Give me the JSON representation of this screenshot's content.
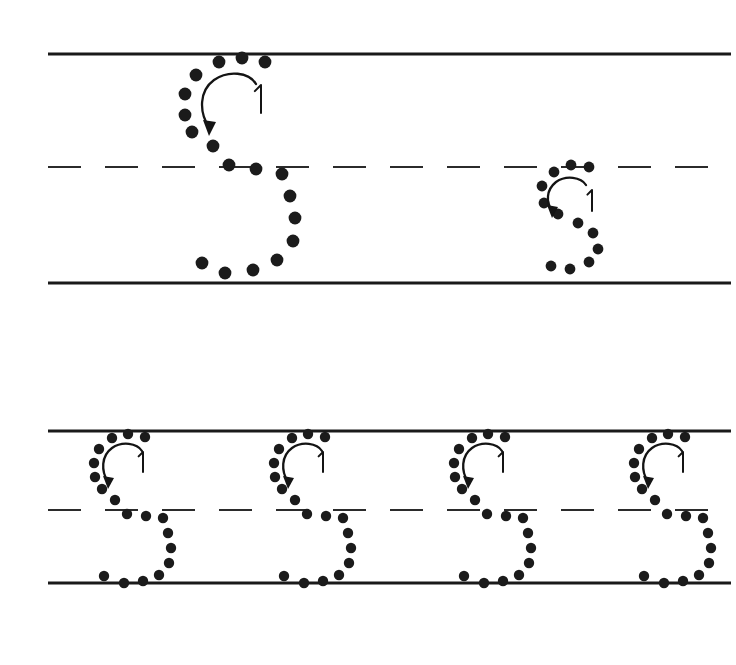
{
  "worksheet": {
    "title": "Letter S Tracing Practice",
    "letter": "S",
    "page_width": 736,
    "page_height": 665,
    "background_color": "#ffffff",
    "ink_color": "#1b1b1b",
    "rule_color": "#1a1a1a",
    "stroke_number_label": "1",
    "stroke_count": 1,
    "dot_style": "dotted-outline"
  },
  "rules": {
    "line_left_x": 48,
    "line_right_x": 731,
    "solid_thickness": 3.2,
    "dashed_thickness": 2.1,
    "dash_length": 33,
    "dash_gap": 24,
    "rows": [
      {
        "name": "row-1",
        "topline_y": 54,
        "midline_y": 167,
        "baseline_y": 283
      },
      {
        "name": "row-2",
        "topline_y": 431,
        "midline_y": 510,
        "baseline_y": 583
      }
    ]
  },
  "letters": [
    {
      "id": "letter-1",
      "row": "row-1",
      "case": "uppercase",
      "glyph": "S",
      "size": "large",
      "dot_radius": 6.4,
      "origin_x": 175,
      "origin_y": 54,
      "number_label": "1",
      "number_x": 261,
      "number_y": 85,
      "number_height": 28,
      "dots": [
        [
          242,
          58
        ],
        [
          265,
          62
        ],
        [
          219,
          62
        ],
        [
          196,
          75
        ],
        [
          185,
          94
        ],
        [
          185,
          115
        ],
        [
          192,
          132
        ],
        [
          213,
          146
        ],
        [
          229,
          165
        ],
        [
          256,
          169
        ],
        [
          282,
          174
        ],
        [
          290,
          196
        ],
        [
          295,
          218
        ],
        [
          293,
          241
        ],
        [
          277,
          260
        ],
        [
          253,
          270
        ],
        [
          225,
          273
        ],
        [
          202,
          263
        ]
      ],
      "arrow": {
        "path": "M 256,84 C 249,72 228,70 214,80 C 199,91 199,112 209,127",
        "head": [
          [
            209,
            136
          ],
          [
            203,
            120
          ],
          [
            216,
            122
          ]
        ]
      }
    },
    {
      "id": "letter-2",
      "row": "row-1",
      "case": "lowercase",
      "glyph": "s",
      "size": "small",
      "dot_radius": 5.4,
      "origin_x": 535,
      "origin_y": 167,
      "number_label": "1",
      "number_x": 592,
      "number_y": 190,
      "number_height": 21,
      "dots": [
        [
          571,
          165
        ],
        [
          589,
          167
        ],
        [
          554,
          172
        ],
        [
          542,
          186
        ],
        [
          544,
          203
        ],
        [
          558,
          214
        ],
        [
          578,
          223
        ],
        [
          593,
          233
        ],
        [
          598,
          249
        ],
        [
          589,
          262
        ],
        [
          570,
          269
        ],
        [
          551,
          266
        ]
      ],
      "arrow": {
        "path": "M 586,185 C 581,177 566,175 556,182 C 546,190 546,202 552,211",
        "head": [
          [
            552,
            218
          ],
          [
            547,
            205
          ],
          [
            558,
            207
          ]
        ]
      }
    },
    {
      "id": "letter-3",
      "row": "row-2",
      "case": "uppercase",
      "glyph": "S",
      "size": "medium",
      "dot_radius": 5.2,
      "origin_x": 92,
      "origin_y": 431,
      "number_label": "1",
      "number_x": 143,
      "number_y": 452,
      "number_height": 20,
      "dots": [
        [
          128,
          434
        ],
        [
          145,
          437
        ],
        [
          112,
          438
        ],
        [
          99,
          449
        ],
        [
          94,
          463
        ],
        [
          95,
          477
        ],
        [
          102,
          489
        ],
        [
          115,
          500
        ],
        [
          127,
          514
        ],
        [
          146,
          516
        ],
        [
          163,
          518
        ],
        [
          168,
          533
        ],
        [
          171,
          548
        ],
        [
          169,
          563
        ],
        [
          159,
          575
        ],
        [
          143,
          581
        ],
        [
          124,
          583
        ],
        [
          104,
          576
        ]
      ],
      "arrow": {
        "path": "M 142,451 C 137,443 122,441 112,448 C 101,456 101,471 108,482",
        "head": [
          [
            108,
            489
          ],
          [
            103,
            476
          ],
          [
            114,
            478
          ]
        ]
      }
    },
    {
      "id": "letter-4",
      "row": "row-2",
      "case": "uppercase",
      "glyph": "S",
      "size": "medium",
      "dot_radius": 5.2,
      "origin_x": 272,
      "origin_y": 431,
      "number_label": "1",
      "number_x": 323,
      "number_y": 452,
      "number_height": 20,
      "dots": [
        [
          308,
          434
        ],
        [
          325,
          437
        ],
        [
          292,
          438
        ],
        [
          279,
          449
        ],
        [
          274,
          463
        ],
        [
          275,
          477
        ],
        [
          282,
          489
        ],
        [
          295,
          500
        ],
        [
          307,
          514
        ],
        [
          326,
          516
        ],
        [
          343,
          518
        ],
        [
          348,
          533
        ],
        [
          351,
          548
        ],
        [
          349,
          563
        ],
        [
          339,
          575
        ],
        [
          323,
          581
        ],
        [
          304,
          583
        ],
        [
          284,
          576
        ]
      ],
      "arrow": {
        "path": "M 322,451 C 317,443 302,441 292,448 C 281,456 281,471 288,482",
        "head": [
          [
            288,
            489
          ],
          [
            283,
            476
          ],
          [
            294,
            478
          ]
        ]
      }
    },
    {
      "id": "letter-5",
      "row": "row-2",
      "case": "uppercase",
      "glyph": "S",
      "size": "medium",
      "dot_radius": 5.2,
      "origin_x": 452,
      "origin_y": 431,
      "number_label": "1",
      "number_x": 503,
      "number_y": 452,
      "number_height": 20,
      "dots": [
        [
          488,
          434
        ],
        [
          505,
          437
        ],
        [
          472,
          438
        ],
        [
          459,
          449
        ],
        [
          454,
          463
        ],
        [
          455,
          477
        ],
        [
          462,
          489
        ],
        [
          475,
          500
        ],
        [
          487,
          514
        ],
        [
          506,
          516
        ],
        [
          523,
          518
        ],
        [
          528,
          533
        ],
        [
          531,
          548
        ],
        [
          529,
          563
        ],
        [
          519,
          575
        ],
        [
          503,
          581
        ],
        [
          484,
          583
        ],
        [
          464,
          576
        ]
      ],
      "arrow": {
        "path": "M 502,451 C 497,443 482,441 472,448 C 461,456 461,471 468,482",
        "head": [
          [
            468,
            489
          ],
          [
            463,
            476
          ],
          [
            474,
            478
          ]
        ]
      }
    },
    {
      "id": "letter-6",
      "row": "row-2",
      "case": "uppercase",
      "glyph": "S",
      "size": "medium",
      "dot_radius": 5.2,
      "origin_x": 632,
      "origin_y": 431,
      "number_label": "1",
      "number_x": 683,
      "number_y": 452,
      "number_height": 20,
      "dots": [
        [
          668,
          434
        ],
        [
          685,
          437
        ],
        [
          652,
          438
        ],
        [
          639,
          449
        ],
        [
          634,
          463
        ],
        [
          635,
          477
        ],
        [
          642,
          489
        ],
        [
          655,
          500
        ],
        [
          667,
          514
        ],
        [
          686,
          516
        ],
        [
          703,
          518
        ],
        [
          708,
          533
        ],
        [
          711,
          548
        ],
        [
          709,
          563
        ],
        [
          699,
          575
        ],
        [
          683,
          581
        ],
        [
          664,
          583
        ],
        [
          644,
          576
        ]
      ],
      "arrow": {
        "path": "M 682,451 C 677,443 662,441 652,448 C 641,456 641,471 648,482",
        "head": [
          [
            648,
            489
          ],
          [
            643,
            476
          ],
          [
            654,
            478
          ]
        ]
      }
    }
  ]
}
